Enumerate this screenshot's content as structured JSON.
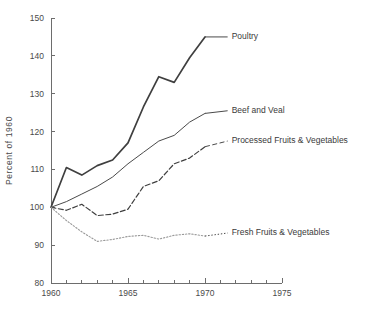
{
  "chart_data": {
    "type": "line",
    "title": "",
    "subtitle": "",
    "xlabel": "",
    "ylabel": "Percent of 1960",
    "xlim": [
      1960,
      1975
    ],
    "ylim": [
      80,
      150
    ],
    "grid": false,
    "legend_position": "inline-right-of-line-end",
    "y_ticks": [
      80,
      90,
      100,
      110,
      120,
      130,
      140,
      150
    ],
    "y_tick_labels": [
      "80",
      "90",
      "100",
      "110",
      "120",
      "130",
      "140",
      "150"
    ],
    "x_ticks_major": [
      1960,
      1965,
      1970,
      1975
    ],
    "x_tick_labels": [
      "1960",
      "1965",
      "1970",
      "1975"
    ],
    "x_ticks_minor": [
      1961,
      1962,
      1963,
      1964,
      1966,
      1967,
      1968,
      1969,
      1971,
      1972,
      1973,
      1974
    ],
    "x": [
      1960,
      1961,
      1962,
      1963,
      1964,
      1965,
      1966,
      1967,
      1968,
      1969,
      1970
    ],
    "series": [
      {
        "name": "Poultry",
        "label": "Poultry",
        "style": "solid",
        "color": "#3f3f3f",
        "width": 1.7,
        "values": [
          100,
          110.5,
          108.5,
          111,
          112.5,
          117,
          126.5,
          134.5,
          133,
          139.5,
          145
        ],
        "label_anchor": {
          "x": 1971.6,
          "y": 145.0
        },
        "leader_from": {
          "x": 1970.0,
          "y": 145.0
        }
      },
      {
        "name": "Beef and Veal",
        "label": "Beef and Veal",
        "style": "solid",
        "color": "#4a4a4a",
        "width": 1.0,
        "values": [
          100,
          101.5,
          103.5,
          105.5,
          108,
          111.5,
          114.5,
          117.5,
          119,
          122.5,
          124.8
        ],
        "label_anchor": {
          "x": 1971.6,
          "y": 125.5
        },
        "leader_from": {
          "x": 1970.0,
          "y": 124.8
        }
      },
      {
        "name": "Processed Fruits & Vegetables",
        "label": "Processed Fruits & Vegetables",
        "style": "dashed",
        "color": "#3f3f3f",
        "width": 1.2,
        "values": [
          100,
          99.2,
          100.8,
          97.8,
          98.2,
          99.5,
          105.5,
          107,
          111.5,
          113,
          116
        ],
        "label_anchor": {
          "x": 1971.6,
          "y": 117.5
        },
        "leader_from": {
          "x": 1970.0,
          "y": 116.0
        }
      },
      {
        "name": "Fresh Fruits & Vegetables",
        "label": "Fresh Fruits & Vegetables",
        "style": "dotted",
        "color": "#9a9a9a",
        "width": 1.1,
        "values": [
          100,
          96.5,
          93.5,
          91.0,
          91.5,
          92.3,
          92.6,
          91.6,
          92.6,
          93.0,
          92.4
        ],
        "label_anchor": {
          "x": 1971.6,
          "y": 93.2
        },
        "leader_from": {
          "x": 1970.0,
          "y": 92.4
        }
      }
    ]
  }
}
